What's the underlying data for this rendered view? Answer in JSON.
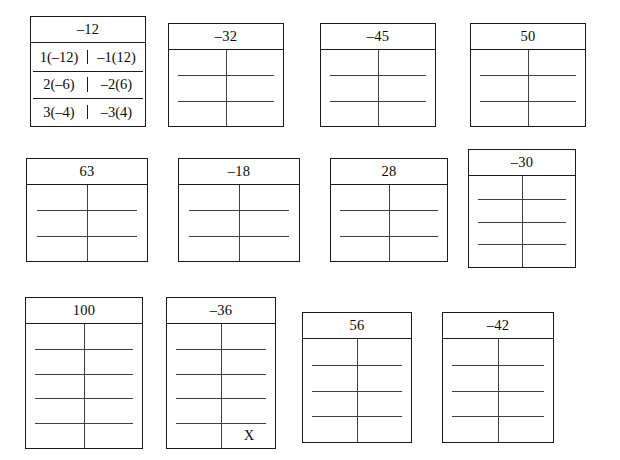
{
  "page": {
    "kind": "math-worksheet",
    "background_color": "#ffffff",
    "ink_color": "#1a1a1a",
    "rule_color": "#404040"
  },
  "boxes": [
    {
      "id": "box-neg12-example",
      "product": "‒12",
      "type": "example",
      "x": 30,
      "y": 16,
      "w": 116,
      "h": 111,
      "header_h": 26,
      "rows": [
        {
          "left": "1(‒12)",
          "right": "‒1(12)"
        },
        {
          "left": "2(‒6)",
          "right": "‒2(6)"
        },
        {
          "left": "3(‒4)",
          "right": "‒3(4)"
        }
      ]
    },
    {
      "id": "box-neg32",
      "product": "‒32",
      "type": "blank",
      "x": 168,
      "y": 23,
      "w": 116,
      "h": 104,
      "header_h": 26,
      "rule_count": 2,
      "mark": null
    },
    {
      "id": "box-neg45",
      "product": "‒45",
      "type": "blank",
      "x": 320,
      "y": 23,
      "w": 116,
      "h": 104,
      "header_h": 26,
      "rule_count": 2,
      "mark": null
    },
    {
      "id": "box-50",
      "product": "50",
      "type": "blank",
      "x": 470,
      "y": 23,
      "w": 116,
      "h": 104,
      "header_h": 26,
      "rule_count": 2,
      "mark": null
    },
    {
      "id": "box-63",
      "product": "63",
      "type": "blank",
      "x": 26,
      "y": 158,
      "w": 122,
      "h": 104,
      "header_h": 26,
      "rule_count": 2,
      "mark": null
    },
    {
      "id": "box-neg18",
      "product": "‒18",
      "type": "blank",
      "x": 178,
      "y": 158,
      "w": 122,
      "h": 104,
      "header_h": 26,
      "rule_count": 2,
      "mark": null
    },
    {
      "id": "box-28",
      "product": "28",
      "type": "blank",
      "x": 330,
      "y": 158,
      "w": 118,
      "h": 104,
      "header_h": 26,
      "rule_count": 2,
      "mark": null
    },
    {
      "id": "box-neg30",
      "product": "‒30",
      "type": "blank",
      "x": 468,
      "y": 149,
      "w": 108,
      "h": 119,
      "header_h": 26,
      "rule_count": 3,
      "mark": null
    },
    {
      "id": "box-100",
      "product": "100",
      "type": "blank",
      "x": 25,
      "y": 297,
      "w": 118,
      "h": 152,
      "header_h": 26,
      "rule_count": 4,
      "mark": null
    },
    {
      "id": "box-neg36",
      "product": "‒36",
      "type": "blank",
      "x": 166,
      "y": 297,
      "w": 110,
      "h": 152,
      "header_h": 26,
      "rule_count": 4,
      "mark": {
        "text": "X",
        "col": "right",
        "row": "bottom"
      }
    },
    {
      "id": "box-56",
      "product": "56",
      "type": "blank",
      "x": 302,
      "y": 312,
      "w": 110,
      "h": 131,
      "header_h": 26,
      "rule_count": 3,
      "mark": null
    },
    {
      "id": "box-neg42",
      "product": "‒42",
      "type": "blank",
      "x": 442,
      "y": 312,
      "w": 112,
      "h": 131,
      "header_h": 26,
      "rule_count": 3,
      "mark": null
    }
  ]
}
